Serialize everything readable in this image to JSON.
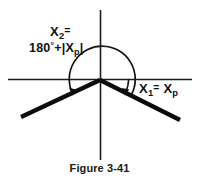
{
  "figure": {
    "caption": "Figure 3-41",
    "labels": {
      "x2_name": "X",
      "x2_sub": "2",
      "x2_eq": "=",
      "x2_expr_deg": "180",
      "x2_expr_degsym": "°",
      "x2_expr_plus": "+",
      "x2_expr_absopen": "|",
      "x2_expr_var": "X",
      "x2_expr_varsub": "p",
      "x2_expr_absclose": "|",
      "x1_name": "X",
      "x1_sub": "1",
      "x1_eq": "=",
      "x1_var": "X",
      "x1_varsub": "p",
      "x2_full": "X2 = 180° + |Xp|",
      "x1_full": "X1 = Xp"
    },
    "colors": {
      "ink": "#111111",
      "axis": "#222222",
      "background": "#ffffff"
    },
    "geometry": {
      "origin_x": 100,
      "origin_y": 80,
      "h_axis_x1": 8,
      "h_axis_x2": 192,
      "h_axis_y": 79.5,
      "v_axis_y1": 10,
      "v_axis_y2": 160,
      "v_axis_x": 100.5,
      "ray_left_end_x": 21,
      "ray_left_end_y": 117,
      "ray_right_end_x": 180,
      "ray_right_end_y": 120,
      "ray_width": 4.2,
      "axis_width": 1.5,
      "big_arc_radius": 33,
      "small_arc_radius": 28
    }
  }
}
